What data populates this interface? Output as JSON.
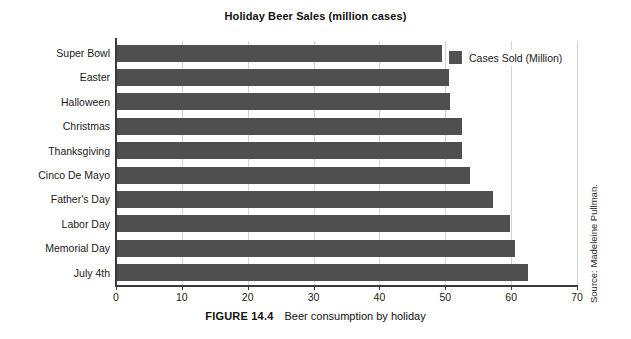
{
  "chart_data": {
    "type": "bar",
    "orientation": "horizontal",
    "title": "Holiday Beer Sales (million cases)",
    "xlabel": "",
    "ylabel": "",
    "xlim": [
      0,
      70
    ],
    "xticks": [
      0,
      10,
      20,
      30,
      40,
      50,
      60,
      70
    ],
    "grid": "vertical",
    "legend_position": "top-right",
    "series": [
      {
        "name": "Cases Sold (Million)",
        "color": "#4f4f4f",
        "values": [
          49.5,
          50.6,
          50.7,
          52.6,
          52.5,
          53.8,
          57.2,
          59.8,
          60.6,
          62.5
        ]
      }
    ],
    "categories": [
      "Super Bowl",
      "Easter",
      "Halloween",
      "Christmas",
      "Thanksgiving",
      "Cinco De Mayo",
      "Father's Day",
      "Labor Day",
      "Memorial Day",
      "July 4th"
    ]
  },
  "legend": {
    "entries": [
      {
        "label": "Cases Sold (Million)"
      }
    ]
  },
  "source": {
    "text": "Source: Madeleine Pullman."
  },
  "caption": {
    "figure_number": "FIGURE 14.4",
    "text": "Beer consumption by holiday"
  },
  "colors": {
    "bar": "#4f4f4f",
    "axis": "#3a3a3a",
    "grid": "#d2d2d2",
    "text": "#1a1a1a",
    "background": "#ffffff"
  }
}
